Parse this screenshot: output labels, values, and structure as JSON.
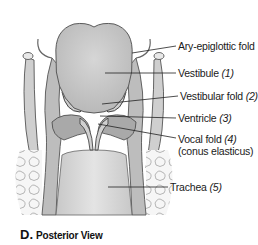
{
  "figure": {
    "view_letter": "D.",
    "view_title": "Posterior View",
    "labels": [
      {
        "text": "Ary-epiglottic fold",
        "num": ""
      },
      {
        "text": "Vestibule",
        "num": "(1)"
      },
      {
        "text": "Vestibular fold",
        "num": "(2)"
      },
      {
        "text": "Ventricle",
        "num": "(3)"
      },
      {
        "text": "Vocal fold",
        "num": "(4)",
        "sub": "(conus elasticus)"
      },
      {
        "text": "Trachea",
        "num": "(5)"
      }
    ],
    "colors": {
      "tissue_fill": "#d4d4d4",
      "outline": "#555555",
      "muscle_fill": "#a8a8a8",
      "leader_line": "#222222"
    }
  }
}
